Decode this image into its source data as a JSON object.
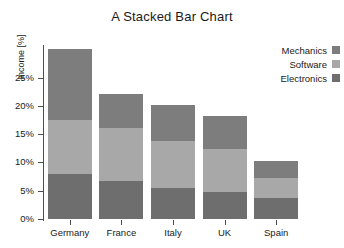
{
  "chart_data": {
    "type": "bar",
    "subtype": "stacked",
    "title": "A Stacked Bar Chart",
    "xlabel": "",
    "ylabel": "Income [%]",
    "categories": [
      "Germany",
      "France",
      "Italy",
      "UK",
      "Spain"
    ],
    "series": [
      {
        "name": "Electronics",
        "values": [
          8.0,
          6.8,
          5.4,
          4.7,
          3.8
        ],
        "color": "#6e6e6e"
      },
      {
        "name": "Software",
        "values": [
          9.5,
          9.2,
          8.4,
          7.6,
          3.4
        ],
        "color": "#a8a8a8"
      },
      {
        "name": "Mechanics",
        "values": [
          12.5,
          6.1,
          6.4,
          5.9,
          3.0
        ],
        "color": "#7d7d7d"
      }
    ],
    "totals": [
      30.0,
      22.1,
      20.2,
      18.2,
      10.2
    ],
    "ylim": [
      0,
      30.4
    ],
    "yticks": [
      0,
      5,
      10,
      15,
      20,
      25
    ],
    "ytick_labels": [
      "0%",
      "5%",
      "10%",
      "15%",
      "20%",
      "25%"
    ],
    "grid": false,
    "legend_position": "top-right",
    "legend_order": [
      "Mechanics",
      "Software",
      "Electronics"
    ],
    "background_color": "#ffffff",
    "axis_color": "#4d4d4d",
    "text_color": "#1a1a1a"
  }
}
